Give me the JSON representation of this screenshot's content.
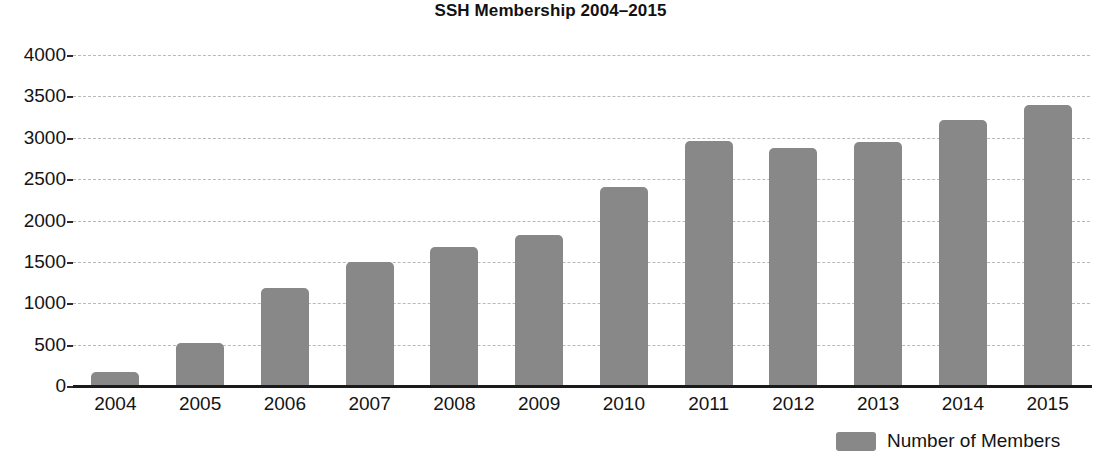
{
  "chart_data": {
    "type": "bar",
    "title": "SSH Membership 2004–2015",
    "xlabel": "",
    "ylabel": "",
    "ylim": [
      0,
      4000
    ],
    "ytick_values": [
      0,
      500,
      1000,
      1500,
      2000,
      2500,
      3000,
      3500,
      4000
    ],
    "ytick_labels": [
      "0",
      "500",
      "1000",
      "1500",
      "2000",
      "2500",
      "3000",
      "3500",
      "4000"
    ],
    "grid": true,
    "grid_axis": "y",
    "legend_position": "bottom-right",
    "categories": [
      "2004",
      "2005",
      "2006",
      "2007",
      "2008",
      "2009",
      "2010",
      "2011",
      "2012",
      "2013",
      "2014",
      "2015"
    ],
    "series": [
      {
        "name": "Number of Members",
        "color": "#888888",
        "values": [
          170,
          520,
          1190,
          1500,
          1680,
          1820,
          2410,
          2960,
          2880,
          2950,
          3210,
          3390
        ]
      }
    ]
  },
  "legend": {
    "items": [
      {
        "label": "Number of Members",
        "color": "#888888"
      }
    ]
  },
  "colors": {
    "bar": "#888888",
    "gridline": "#b9b9bd",
    "axis": "#1b1b1b",
    "text": "#141414",
    "background": "#ffffff"
  }
}
